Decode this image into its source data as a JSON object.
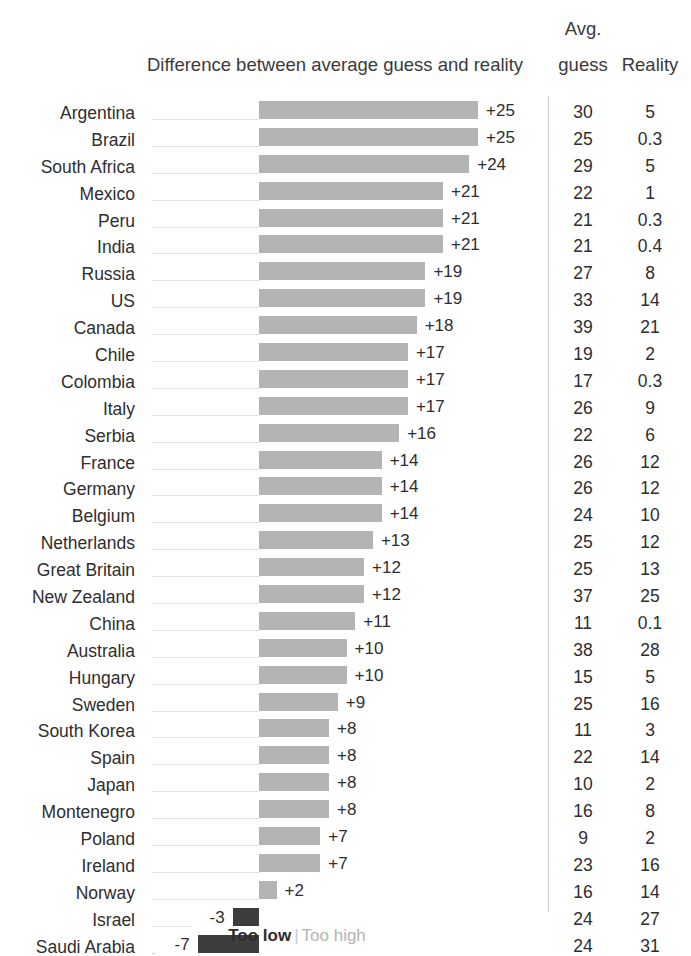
{
  "header": {
    "chart_title": "Difference between average guess and reality",
    "avg_label_line1": "Avg.",
    "avg_label_line2": "guess",
    "reality_label": "Reality"
  },
  "legend": {
    "too_low_label": "Too low",
    "separator": "|",
    "too_high_label": "Too high",
    "too_low_color": "#3d3d3d",
    "too_high_color": "#b4b4b4"
  },
  "axis": {
    "zero_x_px": 259,
    "px_per_unit": 8.76
  },
  "chart_data": {
    "type": "bar",
    "orientation": "horizontal",
    "title": "Difference between average guess and reality",
    "xlabel": "",
    "ylabel": "",
    "grid": false,
    "legend_position": "bottom",
    "columns": [
      "Country",
      "Difference",
      "Avg. guess",
      "Reality"
    ],
    "categories": [
      "Argentina",
      "Brazil",
      "South Africa",
      "Mexico",
      "Peru",
      "India",
      "Russia",
      "US",
      "Canada",
      "Chile",
      "Colombia",
      "Italy",
      "Serbia",
      "France",
      "Germany",
      "Belgium",
      "Netherlands",
      "Great Britain",
      "New Zealand",
      "China",
      "Australia",
      "Hungary",
      "Sweden",
      "South Korea",
      "Spain",
      "Japan",
      "Montenegro",
      "Poland",
      "Ireland",
      "Norway",
      "Israel",
      "Saudi Arabia"
    ],
    "values": [
      25,
      25,
      24,
      21,
      21,
      21,
      19,
      19,
      18,
      17,
      17,
      17,
      16,
      14,
      14,
      14,
      13,
      12,
      12,
      11,
      10,
      10,
      9,
      8,
      8,
      8,
      8,
      7,
      7,
      2,
      -3,
      -7
    ],
    "value_labels": [
      "+25",
      "+25",
      "+24",
      "+21",
      "+21",
      "+21",
      "+19",
      "+19",
      "+18",
      "+17",
      "+17",
      "+17",
      "+16",
      "+14",
      "+14",
      "+14",
      "+13",
      "+12",
      "+12",
      "+11",
      "+10",
      "+10",
      "+9",
      "+8",
      "+8",
      "+8",
      "+8",
      "+7",
      "+7",
      "+2",
      "-3",
      "-7"
    ],
    "series": [
      {
        "name": "Avg. guess",
        "values": [
          "30",
          "25",
          "29",
          "22",
          "21",
          "21",
          "27",
          "33",
          "39",
          "19",
          "17",
          "26",
          "22",
          "26",
          "26",
          "24",
          "25",
          "25",
          "37",
          "11",
          "38",
          "15",
          "25",
          "11",
          "22",
          "10",
          "16",
          "9",
          "23",
          "16",
          "24",
          "24"
        ]
      },
      {
        "name": "Reality",
        "values": [
          "5",
          "0.3",
          "5",
          "1",
          "0.3",
          "0.4",
          "8",
          "14",
          "21",
          "2",
          "0.3",
          "9",
          "6",
          "12",
          "12",
          "10",
          "12",
          "13",
          "25",
          "0.1",
          "28",
          "5",
          "16",
          "3",
          "14",
          "2",
          "8",
          "2",
          "16",
          "14",
          "27",
          "31"
        ]
      }
    ]
  }
}
